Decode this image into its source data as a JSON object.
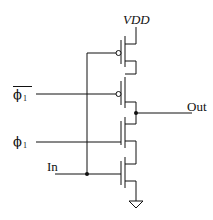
{
  "diagram": {
    "type": "CMOS clocked inverter (C2MOS) transistor schematic",
    "labels": {
      "supply": "VDD",
      "output": "Out",
      "input": "In",
      "clock_bar": {
        "symbol": "ϕ",
        "subscript": "1",
        "overbar": true
      },
      "clock": {
        "symbol": "ϕ",
        "subscript": "1",
        "overbar": false
      }
    },
    "transistors": [
      {
        "id": "M1",
        "type": "PMOS",
        "gate": "In",
        "position": "top"
      },
      {
        "id": "M2",
        "type": "PMOS",
        "gate": "ϕ1_bar",
        "position": "upper-middle"
      },
      {
        "id": "M3",
        "type": "NMOS",
        "gate": "ϕ1",
        "position": "lower-middle"
      },
      {
        "id": "M4",
        "type": "NMOS",
        "gate": "In",
        "position": "bottom"
      }
    ],
    "nodes": [
      "VDD",
      "Out",
      "In",
      "GND"
    ],
    "colors": {
      "stroke": "#111111",
      "background": "#ffffff"
    }
  }
}
